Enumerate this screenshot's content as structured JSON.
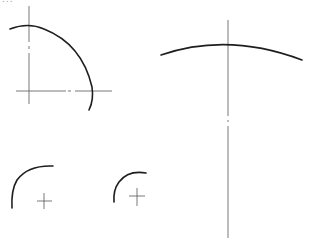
{
  "page": {
    "type": "technical-drawing",
    "background": "#ffffff",
    "stroke_color": "#1e1e1e",
    "centerline_color": "#6a6a6a",
    "top_cropped_text": "..."
  },
  "figures": [
    {
      "name": "quarter-arc-with-centerlines",
      "description": "Large arc (~100°) with crossing dash-dot center lines",
      "center": [
        28,
        91
      ],
      "radius": 64
    },
    {
      "name": "large-radius-arc",
      "description": "Shallow arc crossed by a long vertical center line",
      "vertical_line_x": 228
    },
    {
      "name": "small-arc-left",
      "description": "Small arc with center cross mark",
      "center": [
        44,
        201
      ]
    },
    {
      "name": "small-arc-right",
      "description": "Smaller arc with center cross mark",
      "center": [
        136,
        196
      ]
    }
  ]
}
